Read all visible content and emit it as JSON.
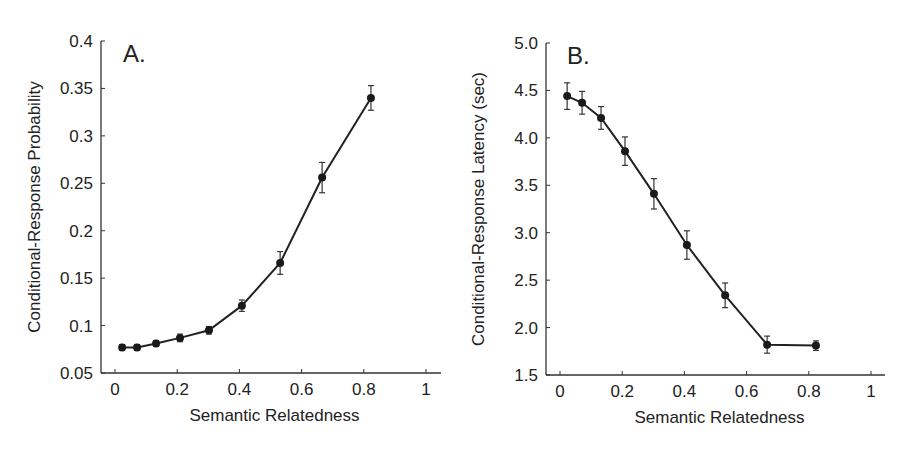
{
  "chart_data": [
    {
      "type": "line",
      "panel_label": "A.",
      "title": "",
      "xlabel": "Semantic Relatedness",
      "ylabel": "Conditional-Response Probability",
      "xlim": [
        0,
        1
      ],
      "ylim": [
        0.05,
        0.4
      ],
      "xticks": [
        "0",
        "0.2",
        "0.4",
        "0.6",
        "0.8",
        "1"
      ],
      "yticks": [
        "0.05",
        "0.1",
        "0.15",
        "0.2",
        "0.25",
        "0.3",
        "0.35",
        "0.4"
      ],
      "grid": false,
      "legend": null,
      "error_bars": true,
      "x": [
        0.023,
        0.071,
        0.132,
        0.209,
        0.302,
        0.408,
        0.531,
        0.666,
        0.823
      ],
      "values": [
        0.077,
        0.077,
        0.081,
        0.087,
        0.095,
        0.121,
        0.166,
        0.256,
        0.34
      ],
      "errors": [
        0.003,
        0.003,
        0.003,
        0.004,
        0.004,
        0.006,
        0.012,
        0.016,
        0.013
      ]
    },
    {
      "type": "line",
      "panel_label": "B.",
      "title": "",
      "xlabel": "Semantic Relatedness",
      "ylabel": "Conditional-Response Latency (sec)",
      "xlim": [
        0,
        1
      ],
      "ylim": [
        1.5,
        5.0
      ],
      "xticks": [
        "0",
        "0.2",
        "0.4",
        "0.6",
        "0.8",
        "1"
      ],
      "yticks": [
        "1.5",
        "2.0",
        "2.5",
        "3.0",
        "3.5",
        "4.0",
        "4.5",
        "5.0"
      ],
      "grid": false,
      "legend": null,
      "error_bars": true,
      "x": [
        0.023,
        0.071,
        0.132,
        0.209,
        0.302,
        0.408,
        0.531,
        0.666,
        0.823
      ],
      "values": [
        4.44,
        4.37,
        4.21,
        3.86,
        3.41,
        2.87,
        2.34,
        1.82,
        1.81
      ],
      "errors": [
        0.14,
        0.12,
        0.12,
        0.15,
        0.16,
        0.15,
        0.13,
        0.09,
        0.05
      ]
    }
  ]
}
